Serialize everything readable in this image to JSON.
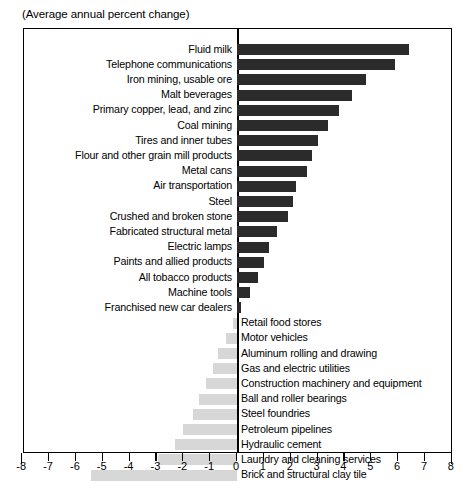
{
  "subtitle": "(Average annual percent change)",
  "chart_data": {
    "type": "bar",
    "orientation": "horizontal",
    "title": "",
    "subtitle": "(Average annual percent change)",
    "xlabel": "",
    "ylabel": "",
    "xlim": [
      -8,
      8
    ],
    "xticks": [
      "-8",
      "-7",
      "-6",
      "-5",
      "-4",
      "-3",
      "-2",
      "-1",
      "0",
      "1",
      "2",
      "3",
      "4",
      "5",
      "6",
      "7",
      "8"
    ],
    "grid": false,
    "legend": null,
    "positive_color": "#2b2b2b",
    "negative_color": "#d7d7d7",
    "categories": [
      "Fluid milk",
      "Telephone communications",
      "Iron mining, usable ore",
      "Malt beverages",
      "Primary copper, lead, and zinc",
      "Coal mining",
      "Tires and inner tubes",
      "Flour and other grain mill products",
      "Metal cans",
      "Air transportation",
      "Steel",
      "Crushed and broken stone",
      "Fabricated structural metal",
      "Electric lamps",
      "Paints and allied products",
      "All tobacco products",
      "Machine tools",
      "Franchised new car dealers",
      "Retail food stores",
      "Motor vehicles",
      "Aluminum rolling and drawing",
      "Gas and electric utilities",
      "Construction machinery and equipment",
      "Ball and roller bearings",
      "Steel foundries",
      "Petroleum pipelines",
      "Hydraulic cement",
      "Laundry and cleaning services",
      "Brick and structural clay tile"
    ],
    "values": [
      6.4,
      5.9,
      4.8,
      4.3,
      3.8,
      3.4,
      3.0,
      2.8,
      2.6,
      2.2,
      2.1,
      1.9,
      1.5,
      1.2,
      1.0,
      0.8,
      0.5,
      0.15,
      -0.15,
      -0.4,
      -0.7,
      -0.9,
      -1.15,
      -1.4,
      -1.65,
      -2.0,
      -2.3,
      -2.95,
      -5.45
    ]
  }
}
